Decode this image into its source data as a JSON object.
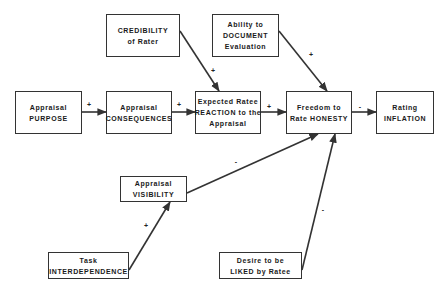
{
  "diagram": {
    "type": "causal-path-model",
    "nodes": [
      {
        "id": "credibility",
        "lines": [
          "CREDIBILITY",
          "of Rater"
        ],
        "x": 106,
        "y": 14,
        "w": 74,
        "h": 43
      },
      {
        "id": "document",
        "lines": [
          "Ability to",
          "DOCUMENT",
          "Evaluation"
        ],
        "x": 212,
        "y": 14,
        "w": 67,
        "h": 43
      },
      {
        "id": "purpose",
        "lines": [
          "Appraisal",
          "PURPOSE"
        ],
        "x": 15,
        "y": 91,
        "w": 67,
        "h": 43
      },
      {
        "id": "consequences",
        "lines": [
          "Appraisal",
          "CONSEQUENCES"
        ],
        "x": 106,
        "y": 91,
        "w": 66,
        "h": 43
      },
      {
        "id": "reaction",
        "lines": [
          "Expected Ratee",
          "REACTION to the",
          "Appraisal"
        ],
        "x": 195,
        "y": 91,
        "w": 66,
        "h": 43
      },
      {
        "id": "honesty",
        "lines": [
          "Freedom to",
          "Rate HONESTY"
        ],
        "x": 286,
        "y": 91,
        "w": 66,
        "h": 43
      },
      {
        "id": "inflation",
        "lines": [
          "Rating",
          "INFLATION"
        ],
        "x": 376,
        "y": 91,
        "w": 58,
        "h": 43
      },
      {
        "id": "visibility",
        "lines": [
          "Appraisal",
          "VISIBILITY"
        ],
        "x": 120,
        "y": 176,
        "w": 67,
        "h": 26
      },
      {
        "id": "interdependence",
        "lines": [
          "Task",
          "INTERDEPENDENCE"
        ],
        "x": 48,
        "y": 252,
        "w": 81,
        "h": 27
      },
      {
        "id": "liked",
        "lines": [
          "Desire to be",
          "LIKED by Ratee"
        ],
        "x": 219,
        "y": 252,
        "w": 83,
        "h": 27
      }
    ],
    "edges": [
      {
        "from": "purpose",
        "to": "consequences",
        "sign": "+",
        "x1": 82,
        "y1": 112,
        "x2": 106,
        "y2": 112,
        "lx": 89,
        "ly": 104
      },
      {
        "from": "consequences",
        "to": "reaction",
        "sign": "+",
        "x1": 172,
        "y1": 112,
        "x2": 195,
        "y2": 112,
        "lx": 179,
        "ly": 104
      },
      {
        "from": "credibility",
        "to": "reaction",
        "sign": "+",
        "x1": 180,
        "y1": 31,
        "x2": 219,
        "y2": 91,
        "lx": 213,
        "ly": 70
      },
      {
        "from": "reaction",
        "to": "honesty",
        "sign": "+",
        "x1": 261,
        "y1": 112,
        "x2": 286,
        "y2": 112,
        "lx": 269,
        "ly": 106
      },
      {
        "from": "document",
        "to": "honesty",
        "sign": "+",
        "x1": 279,
        "y1": 31,
        "x2": 327,
        "y2": 91,
        "lx": 311,
        "ly": 54
      },
      {
        "from": "honesty",
        "to": "inflation",
        "sign": "-",
        "x1": 352,
        "y1": 112,
        "x2": 376,
        "y2": 112,
        "lx": 360,
        "ly": 106
      },
      {
        "from": "visibility",
        "to": "honesty",
        "sign": "-",
        "x1": 187,
        "y1": 193,
        "x2": 318,
        "y2": 134,
        "lx": 236,
        "ly": 161
      },
      {
        "from": "interdependence",
        "to": "visibility",
        "sign": "+",
        "x1": 129,
        "y1": 270,
        "x2": 170,
        "y2": 202,
        "lx": 146,
        "ly": 225
      },
      {
        "from": "liked",
        "to": "honesty",
        "sign": "-",
        "x1": 302,
        "y1": 270,
        "x2": 335,
        "y2": 134,
        "lx": 323,
        "ly": 209
      }
    ]
  },
  "colors": {
    "line": "#333333",
    "box_border": "#333333",
    "background": "#ffffff"
  }
}
